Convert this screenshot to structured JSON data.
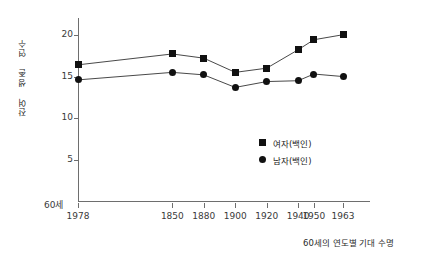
{
  "chart_data": {
    "type": "line",
    "title": "",
    "subtitle": "",
    "xlabel": "60세의 연도별 기대 수명",
    "ylabel": "잔여 생존 연수",
    "categories": [
      "1978",
      "1850",
      "1880",
      "1900",
      "1920",
      "1940",
      "1950",
      "1963"
    ],
    "x_positions": [
      0,
      42,
      56,
      70,
      84,
      98,
      105,
      118
    ],
    "ylim": [
      0,
      22
    ],
    "yticks": [
      5,
      10,
      15,
      20
    ],
    "ytick_labels": [
      "5",
      "10",
      "15",
      "20"
    ],
    "y_origin_label": "60세",
    "grid": false,
    "legend_position": "inside-lower-right",
    "series": [
      {
        "name": "여자(백인)",
        "marker": "square",
        "color": "#111111",
        "values": [
          16.4,
          17.7,
          17.2,
          15.5,
          16.0,
          18.2,
          19.4,
          20.0
        ]
      },
      {
        "name": "남자(백인)",
        "marker": "circle",
        "color": "#111111",
        "values": [
          14.6,
          15.5,
          15.2,
          13.7,
          14.4,
          14.5,
          15.3,
          15.0
        ]
      }
    ]
  },
  "axis": {
    "y_label_text": "잔여 생존 연수",
    "x_label_text": "60세의 연도별 기대 수명",
    "origin_label": "60세"
  },
  "legend": {
    "items": [
      {
        "label": "여자(백인)",
        "marker": "square"
      },
      {
        "label": "남자(백인)",
        "marker": "circle"
      }
    ]
  }
}
